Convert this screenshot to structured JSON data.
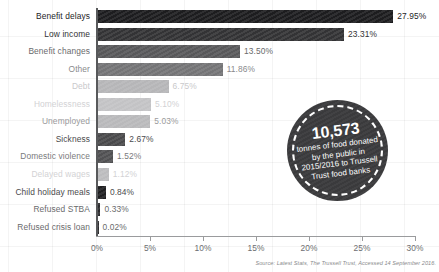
{
  "chart_data": {
    "type": "bar",
    "orientation": "horizontal",
    "title": "",
    "xlabel": "",
    "ylabel": "",
    "xlim": [
      0,
      30
    ],
    "grid": true,
    "categories": [
      "Benefit delays",
      "Low income",
      "Benefit changes",
      "Other",
      "Debt",
      "Homelessness",
      "Unemployed",
      "Sickness",
      "Domestic violence",
      "Delayed wages",
      "Child holiday meals",
      "Refused STBA",
      "Refused crisis loan"
    ],
    "values": [
      27.95,
      23.31,
      13.5,
      11.86,
      6.75,
      5.1,
      5.03,
      2.67,
      1.52,
      1.12,
      0.84,
      0.33,
      0.02
    ],
    "value_labels": [
      "27.95%",
      "23.31%",
      "13.50%",
      "11.86%",
      "6.75%",
      "5.10%",
      "5.03%",
      "2.67%",
      "1.52%",
      "1.12%",
      "0.84%",
      "0.33%",
      "0.02%"
    ],
    "bar_colors": [
      "#1d1d1f",
      "#333335",
      "#58585a",
      "#747476",
      "#b6b6b8",
      "#c3c3c5",
      "#b9b9bb",
      "#4a4a4c",
      "#515153",
      "#bcbcbe",
      "#1f1f21",
      "#2b2b2d",
      "#2b2b2d"
    ],
    "label_colors": [
      "#1d1d1f",
      "#333335",
      "#6a6a6c",
      "#8a8a8c",
      "#c9c9cb",
      "#d2d2d4",
      "#9a9a9c",
      "#4a4a4c",
      "#7a7a7c",
      "#d2d2d4",
      "#4a4a4c",
      "#6a6a6c",
      "#6a6a6c"
    ],
    "tick_labels": [
      "0%",
      "5%",
      "10%",
      "15%",
      "20%",
      "25%",
      "30%"
    ],
    "tick_values": [
      0,
      5,
      10,
      15,
      20,
      25,
      30
    ]
  },
  "badge": {
    "number": "10,573",
    "caption": "tonnes of food donated by the public in 2015/2016 to Trussell Trust food banks",
    "background_color": "#3a3a3c",
    "text_color": "#ffffff"
  },
  "footer": {
    "source": "Source: Latest Stats, The Trussell Trust, Accessed 14 September 2016."
  }
}
